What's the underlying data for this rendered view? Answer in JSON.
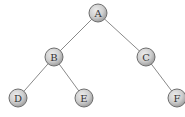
{
  "diagram": {
    "type": "binary-tree",
    "nodes": [
      {
        "id": "A",
        "label": "A",
        "x": 98,
        "y": 13
      },
      {
        "id": "B",
        "label": "B",
        "x": 54,
        "y": 57
      },
      {
        "id": "C",
        "label": "C",
        "x": 146,
        "y": 57
      },
      {
        "id": "D",
        "label": "D",
        "x": 18,
        "y": 98
      },
      {
        "id": "E",
        "label": "E",
        "x": 84,
        "y": 98
      },
      {
        "id": "F",
        "label": "F",
        "x": 177,
        "y": 98
      }
    ],
    "edges": [
      {
        "from": "A",
        "to": "B"
      },
      {
        "from": "A",
        "to": "C"
      },
      {
        "from": "B",
        "to": "D"
      },
      {
        "from": "B",
        "to": "E"
      },
      {
        "from": "C",
        "to": "F"
      }
    ],
    "node_radius": 9,
    "colors": {
      "node_fill_light": "#e2e2e2",
      "node_fill_dark": "#a8a8a8",
      "node_stroke": "#6e6e6e",
      "edge": "#8a8a8a",
      "label": "#333333"
    }
  }
}
